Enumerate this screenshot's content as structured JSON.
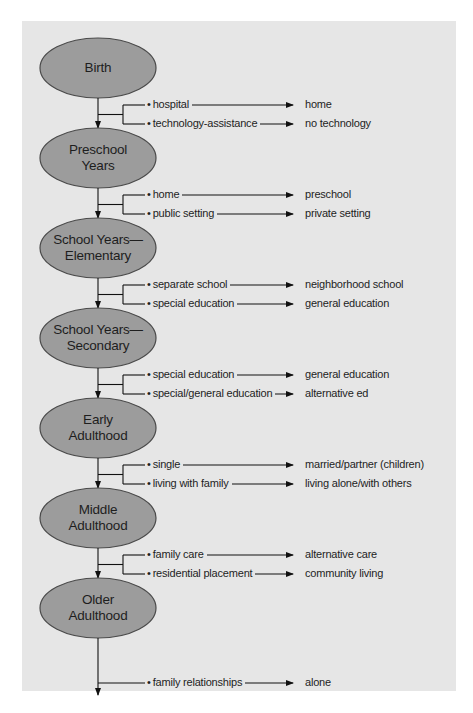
{
  "diagram": {
    "stages": [
      {
        "label_lines": [
          "Birth"
        ],
        "transitions": [
          {
            "from": "hospital",
            "to": "home"
          },
          {
            "from": "technology-assistance",
            "to": "no technology"
          }
        ]
      },
      {
        "label_lines": [
          "Preschool",
          "Years"
        ],
        "transitions": [
          {
            "from": "home",
            "to": "preschool"
          },
          {
            "from": "public setting",
            "to": "private setting"
          }
        ]
      },
      {
        "label_lines": [
          "School Years—",
          "Elementary"
        ],
        "transitions": [
          {
            "from": "separate school",
            "to": "neighborhood school"
          },
          {
            "from": "special education",
            "to": "general education"
          }
        ]
      },
      {
        "label_lines": [
          "School Years—",
          "Secondary"
        ],
        "transitions": [
          {
            "from": "special education",
            "to": "general education"
          },
          {
            "from": "special/general education",
            "to": "alternative ed"
          }
        ]
      },
      {
        "label_lines": [
          "Early",
          "Adulthood"
        ],
        "transitions": [
          {
            "from": "single",
            "to": "married/partner (children)"
          },
          {
            "from": "living with family",
            "to": "living alone/with others"
          }
        ]
      },
      {
        "label_lines": [
          "Middle",
          "Adulthood"
        ],
        "transitions": [
          {
            "from": "family care",
            "to": "alternative care"
          },
          {
            "from": "residential placement",
            "to": "community living"
          }
        ]
      },
      {
        "label_lines": [
          "Older",
          "Adulthood"
        ],
        "transitions": [
          {
            "from": "family relationships",
            "to": "alone"
          }
        ]
      }
    ],
    "bullet": "•",
    "colors": {
      "panel": "#e6e6e6",
      "ellipse_fill": "#9c9c9c",
      "ellipse_stroke": "#4a4a4a",
      "line": "#111111",
      "text": "#1e1e1e"
    }
  }
}
